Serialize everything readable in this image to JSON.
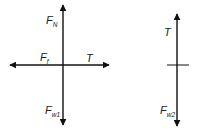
{
  "colors": {
    "stroke": "#111111",
    "text": "#222222",
    "background": "#ffffff"
  },
  "diagram_left": {
    "title": "Free-body diagram object 1",
    "forces": {
      "normal": {
        "label": "F",
        "subscript": "N",
        "direction": "up"
      },
      "friction": {
        "label": "F",
        "subscript": "f",
        "direction": "left"
      },
      "tension": {
        "label": "T",
        "subscript": "",
        "direction": "right"
      },
      "weight": {
        "label": "F",
        "subscript": "w1",
        "direction": "down"
      }
    }
  },
  "diagram_right": {
    "title": "Free-body diagram object 2",
    "forces": {
      "tension": {
        "label": "T",
        "subscript": "",
        "direction": "up"
      },
      "weight": {
        "label": "F",
        "subscript": "w2",
        "direction": "down"
      }
    }
  }
}
